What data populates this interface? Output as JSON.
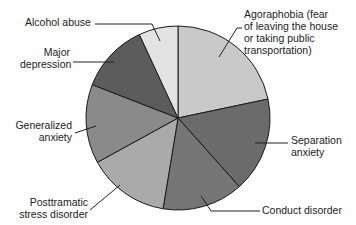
{
  "chart_data": {
    "type": "pie",
    "title": "",
    "start_angle_deg": 90,
    "direction": "clockwise",
    "slices": [
      {
        "label": "Agoraphobia (fear of leaving the house or taking public transportation)",
        "display": "Agoraphobia (fear\nof leaving the house\nor taking public\ntransportation)",
        "value": 21.7,
        "color": "#c9c9c9"
      },
      {
        "label": "Separation anxiety",
        "display": "Separation\nanxiety",
        "value": 16.7,
        "color": "#6b6b6b"
      },
      {
        "label": "Conduct disorder",
        "display": "Conduct disorder",
        "value": 14.2,
        "color": "#757575"
      },
      {
        "label": "Posttramatic stress disorder",
        "display": "Posttramatic\nstress disorder",
        "value": 14.4,
        "color": "#aaaaaa"
      },
      {
        "label": "Generalized anxiety",
        "display": "Generalized\nanxiety",
        "value": 13.9,
        "color": "#8a8a8a"
      },
      {
        "label": "Major depression",
        "display": "Major\ndepression",
        "value": 12.2,
        "color": "#5c5c5c"
      },
      {
        "label": "Alcohol abuse",
        "display": "Alcohol abuse",
        "value": 6.9,
        "color": "#e3e3e3"
      }
    ],
    "legend": "none (callout labels with leader lines)"
  },
  "labels": {
    "agoraphobia": "Agoraphobia (fear\nof leaving the house\nor taking public\ntransportation)",
    "separation": "Separation\nanxiety",
    "conduct": "Conduct disorder",
    "ptsd": "Posttramatic\nstress disorder",
    "generalized": "Generalized\nanxiety",
    "depression": "Major\ndepression",
    "alcohol": "Alcohol abuse"
  }
}
